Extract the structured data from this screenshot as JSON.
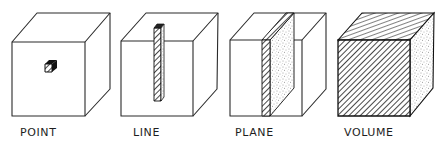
{
  "diagram": {
    "title": "",
    "panels": [
      {
        "id": "point",
        "label": "POINT",
        "description": "cube with a small solid cube at the center of its front face"
      },
      {
        "id": "line",
        "label": "LINE",
        "description": "cube with a thin vertical rod (hatched front, stippled side)"
      },
      {
        "id": "plane",
        "label": "PLANE",
        "description": "cube with a vertical slab (hatched edge, stippled face)"
      },
      {
        "id": "volume",
        "label": "VOLUME",
        "description": "fully filled cube: hatched front and top, stippled side"
      }
    ],
    "colors": {
      "ink": "#2a2a2a",
      "background": "#ffffff"
    }
  }
}
